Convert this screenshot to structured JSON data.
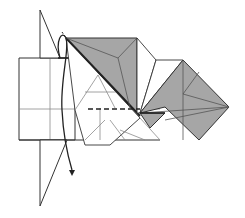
{
  "diagram": {
    "type": "origami-fold-step",
    "colors": {
      "paper_white": "#ffffff",
      "paper_colored": "#a6a6a6",
      "line": "#333333",
      "thin_line": "#8c8c8c",
      "arrow": "#222222"
    },
    "elements": {
      "main_body": "left-rectangular-flap",
      "vertical_flap": "triangular-standing-flap",
      "colored_diamond_top": "shaded-upper-square",
      "colored_diamond_right": "shaded-right-square",
      "valley_fold_line": "dashed-horizontal-valley-fold",
      "fold_arrow": "curved-fold-behind-arrow"
    }
  }
}
